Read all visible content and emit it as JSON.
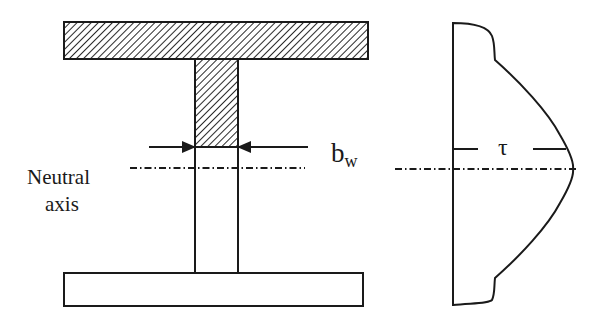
{
  "figure": {
    "type": "shear stress distribution in T-beam / I-section",
    "stroke_color": "#1a1a1a",
    "background": "#ffffff"
  },
  "cross_section": {
    "top_flange": {
      "x": 64,
      "y": 22,
      "width": 304,
      "height": 37,
      "hatched": true
    },
    "web_hatched": {
      "x": 195,
      "y": 59,
      "width": 43,
      "height": 88,
      "hatched": true
    },
    "web_unhatched": {
      "x": 195,
      "y": 147,
      "width": 43,
      "height": 126,
      "hatched": false
    },
    "bottom_flange": {
      "x": 64,
      "y": 273,
      "width": 299,
      "height": 33,
      "hatched": false
    }
  },
  "labels": {
    "neutral_axis_line1": "Neutral",
    "neutral_axis_line2": "axis",
    "web_width_main": "b",
    "web_width_sub": "w",
    "shear_stress": "τ"
  },
  "dimension": {
    "web_width_arrows_y": 147,
    "left_arrow_from_x": 149,
    "right_arrow_to_x": 308
  },
  "neutral_axis": {
    "y_left": 168,
    "left_x_start": 130,
    "left_x_end": 305,
    "y_right": 169,
    "right_x_start": 395,
    "right_x_end": 575
  },
  "stress_profile": {
    "baseline_x": 453,
    "top_y": 23,
    "bottom_y": 305,
    "peak_x": 573,
    "peak_y": 169,
    "tau_marker_y": 149
  }
}
